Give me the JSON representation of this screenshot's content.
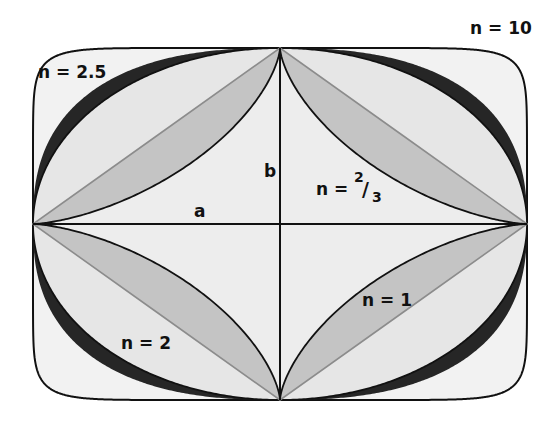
{
  "diagram": {
    "center": [
      280,
      224
    ],
    "a": 247,
    "b": 176,
    "curves": [
      {
        "n": 10,
        "label": "n = 10",
        "role": "outer rounded rectangle"
      },
      {
        "n": 2.5,
        "label": "n = 2.5",
        "role": "outer edge of dark band"
      },
      {
        "n": 2,
        "label": "n = 2",
        "role": "ellipse"
      },
      {
        "n": 1,
        "label": "n = 1",
        "role": "rhombus (gray diagonals)"
      },
      {
        "n": 0.6667,
        "label": "n = 2/3",
        "role": "astroid"
      }
    ],
    "labels": {
      "n10": "n = 10",
      "n25": "n = 2.5",
      "n2": "n = 2",
      "n1": "n = 1",
      "n23_prefix": "n = ",
      "n23_num": "2",
      "n23_slash": "/",
      "n23_den": "3",
      "a": "a",
      "b": "b"
    },
    "colors": {
      "background": "#ffffff",
      "outer_fill": "#f2f2f2",
      "dark_band": "#262626",
      "light_region": "#e6e6e6",
      "lens_region": "#c4c4c4",
      "inner_fill": "#ededed",
      "outline": "#111111",
      "diagonal": "#8c8c8c"
    }
  }
}
